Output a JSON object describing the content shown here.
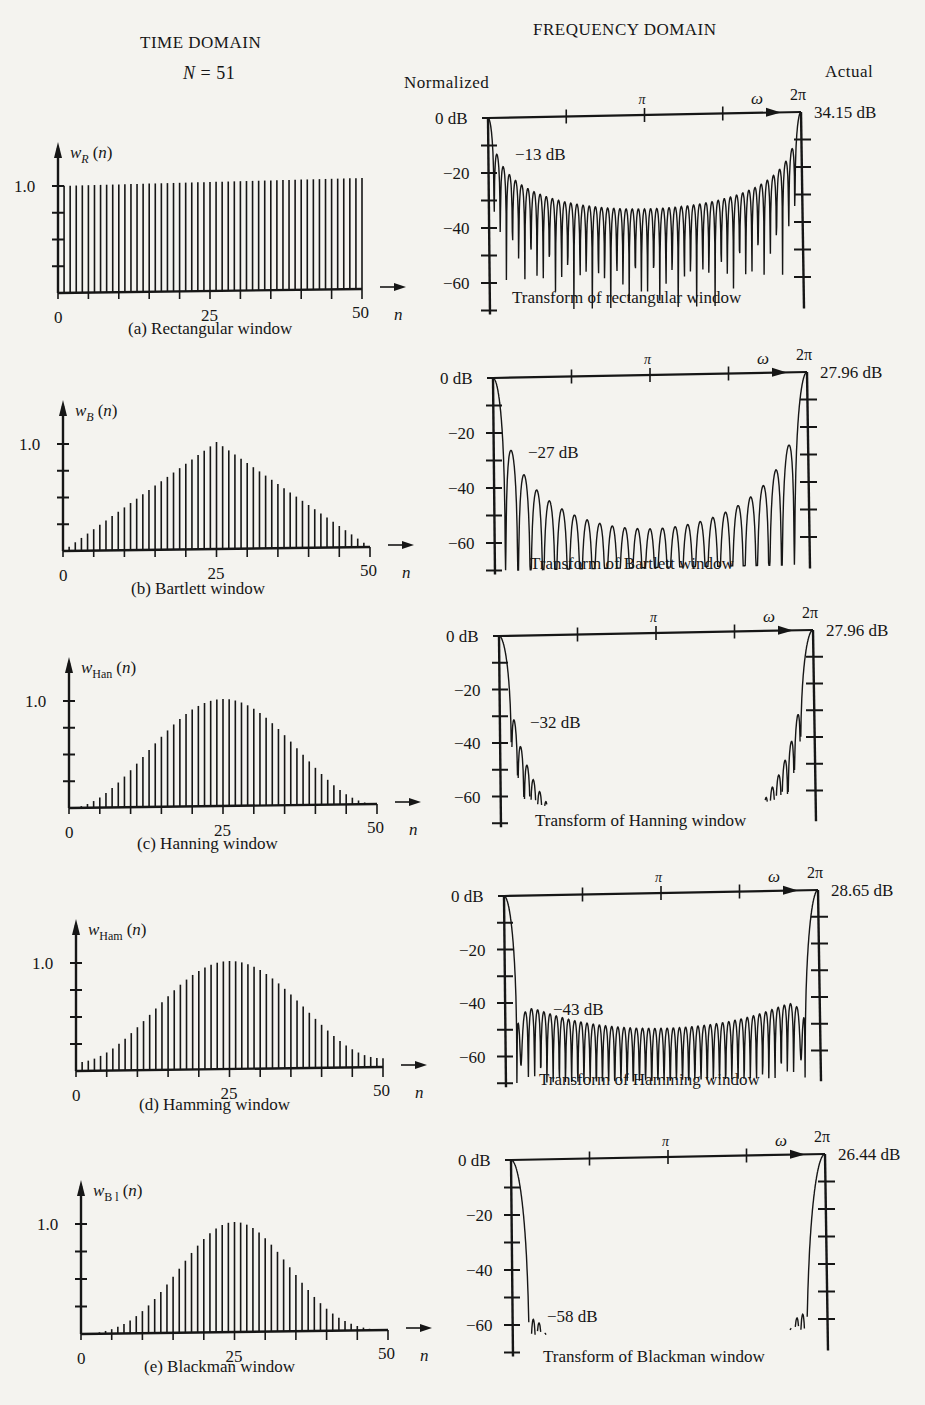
{
  "header": {
    "time_domain": "TIME DOMAIN",
    "n_label_var": "N",
    "n_label_value": " = 51",
    "frequency_domain": "FREQUENCY DOMAIN",
    "normalized": "Normalized",
    "actual": "Actual"
  },
  "colors": {
    "ink": "#161616",
    "paper": "#f4f3ef"
  },
  "chart_data": [
    {
      "id": "a",
      "type": "bar",
      "domain": "time",
      "title": "(a)  Rectangular window",
      "ylabel": "w_R (n)",
      "ylabel_main": "w",
      "ylabel_sub": "R",
      "xlabel": "n",
      "xticks": [
        "0",
        "25",
        "50"
      ],
      "yticks": [
        "1.0"
      ],
      "window": "rectangular",
      "N": 51,
      "ylim": [
        0,
        1.0
      ],
      "xlim": [
        0,
        50
      ]
    },
    {
      "id": "a",
      "type": "line",
      "domain": "frequency",
      "title": "Transform of rectangular window",
      "xlabel": "ω",
      "xticks": [
        "π",
        "2π"
      ],
      "yticks": [
        "0 dB",
        "−20",
        "−40",
        "−60"
      ],
      "ylim": [
        -70,
        0
      ],
      "xlim": [
        0,
        6.2832
      ],
      "first_sidelobe_db": -13,
      "sidelobe_label": "−13 dB",
      "actual_peak": "34.15 dB",
      "sidelobe_decay_db": 6,
      "floor_db": -34
    },
    {
      "id": "b",
      "type": "bar",
      "domain": "time",
      "title": "(b)  Bartlett window",
      "ylabel": "w_B (n)",
      "ylabel_main": "w",
      "ylabel_sub": "B",
      "xlabel": "n",
      "xticks": [
        "0",
        "25",
        "50"
      ],
      "yticks": [
        "1.0"
      ],
      "window": "bartlett",
      "N": 51,
      "ylim": [
        0,
        1.0
      ],
      "xlim": [
        0,
        50
      ]
    },
    {
      "id": "b",
      "type": "line",
      "domain": "frequency",
      "title": "Transform of Bartlett window",
      "xlabel": "ω",
      "xticks": [
        "π",
        "2π"
      ],
      "yticks": [
        "0 dB",
        "−20",
        "−40",
        "−60"
      ],
      "ylim": [
        -70,
        0
      ],
      "xlim": [
        0,
        6.2832
      ],
      "first_sidelobe_db": -27,
      "sidelobe_label": "−27 dB",
      "actual_peak": "27.96 dB",
      "floor_db": -57
    },
    {
      "id": "c",
      "type": "bar",
      "domain": "time",
      "title": "(c)  Hanning window",
      "ylabel": "w_Han (n)",
      "ylabel_main": "w",
      "ylabel_sub": "Han",
      "xlabel": "n",
      "xticks": [
        "0",
        "25",
        "50"
      ],
      "yticks": [
        "1.0"
      ],
      "window": "hanning",
      "N": 51,
      "ylim": [
        0,
        1.0
      ],
      "xlim": [
        0,
        50
      ]
    },
    {
      "id": "c",
      "type": "line",
      "domain": "frequency",
      "title": "Transform of Hanning window",
      "xlabel": "ω",
      "xticks": [
        "π",
        "2π"
      ],
      "yticks": [
        "0 dB",
        "−20",
        "−40",
        "−60"
      ],
      "ylim": [
        -70,
        0
      ],
      "xlim": [
        0,
        6.2832
      ],
      "first_sidelobe_db": -32,
      "sidelobe_label": "−32 dB",
      "actual_peak": "27.96 dB",
      "floor_db": -70
    },
    {
      "id": "d",
      "type": "bar",
      "domain": "time",
      "title": "(d)  Hamming window",
      "ylabel": "w_Ham (n)",
      "ylabel_main": "w",
      "ylabel_sub": "Ham",
      "xlabel": "n",
      "xticks": [
        "0",
        "25",
        "50"
      ],
      "yticks": [
        "1.0"
      ],
      "window": "hamming",
      "N": 51,
      "ylim": [
        0,
        1.0
      ],
      "xlim": [
        0,
        50
      ]
    },
    {
      "id": "d",
      "type": "line",
      "domain": "frequency",
      "title": "Transform of Hamming window",
      "xlabel": "ω",
      "xticks": [
        "π",
        "2π"
      ],
      "yticks": [
        "0 dB",
        "−20",
        "−40",
        "−60"
      ],
      "ylim": [
        -70,
        0
      ],
      "xlim": [
        0,
        6.2832
      ],
      "first_sidelobe_db": -43,
      "sidelobe_label": "−43 dB",
      "actual_peak": "28.65 dB",
      "floor_db": -52
    },
    {
      "id": "e",
      "type": "bar",
      "domain": "time",
      "title": "(e)  Blackman window",
      "ylabel": "w_Bl (n)",
      "ylabel_main": "w",
      "ylabel_sub": "B l",
      "xlabel": "n",
      "xticks": [
        "0",
        "25",
        "50"
      ],
      "yticks": [
        "1.0"
      ],
      "window": "blackman",
      "N": 51,
      "ylim": [
        0,
        1.0
      ],
      "xlim": [
        0,
        50
      ]
    },
    {
      "id": "e",
      "type": "line",
      "domain": "frequency",
      "title": "Transform of Blackman window",
      "xlabel": "ω",
      "xticks": [
        "π",
        "2π"
      ],
      "yticks": [
        "0 dB",
        "−20",
        "−40",
        "−60"
      ],
      "ylim": [
        -70,
        0
      ],
      "xlim": [
        0,
        6.2832
      ],
      "first_sidelobe_db": -58,
      "sidelobe_label": "−58 dB",
      "actual_peak": "26.44 dB",
      "floor_db": -70
    }
  ],
  "layout": {
    "time": [
      {
        "x0": 58,
        "yBase": 293,
        "yTop": 186,
        "x50": 362,
        "capX": 128,
        "capY": 336
      },
      {
        "x0": 63,
        "yBase": 551,
        "yTop": 444,
        "x50": 370,
        "capX": 131,
        "capY": 596
      },
      {
        "x0": 69,
        "yBase": 808,
        "yTop": 701,
        "x50": 377,
        "capX": 137,
        "capY": 851
      },
      {
        "x0": 76,
        "yBase": 1071,
        "yTop": 963,
        "x50": 383,
        "capX": 139,
        "capY": 1112
      },
      {
        "x0": 81,
        "yBase": 1334,
        "yTop": 1224,
        "x50": 388,
        "capX": 144,
        "capY": 1374
      }
    ],
    "freq": [
      {
        "xL": 488,
        "xR": 801,
        "y0": 118,
        "yPer20": 55,
        "capX": 512,
        "capY": 305
      },
      {
        "xL": 493,
        "xR": 807,
        "y0": 378,
        "yPer20": 55,
        "capX": 530,
        "capY": 571
      },
      {
        "xL": 499,
        "xR": 813,
        "y0": 636,
        "yPer20": 53.5,
        "capX": 535,
        "capY": 828
      },
      {
        "xL": 504,
        "xR": 818,
        "y0": 896,
        "yPer20": 53.5,
        "capX": 539,
        "capY": 1087
      },
      {
        "xL": 511,
        "xR": 825,
        "y0": 1160,
        "yPer20": 55,
        "capX": 543,
        "capY": 1364
      }
    ]
  }
}
